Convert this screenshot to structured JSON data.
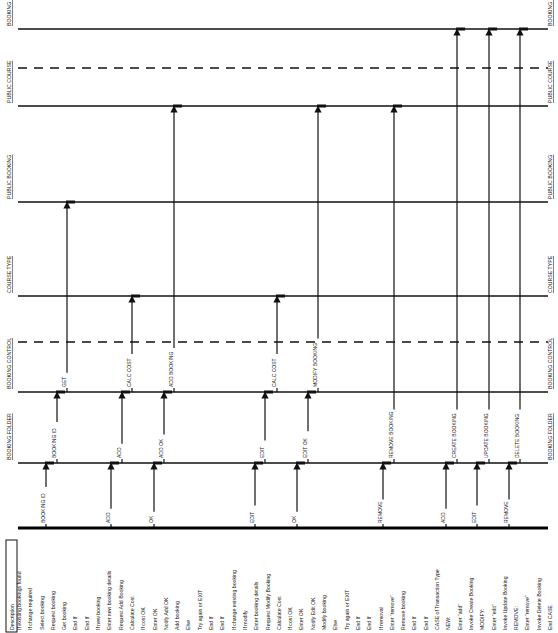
{
  "diagram": {
    "lifelines": [
      {
        "id": "booking_dtx",
        "label": "BOOKING DTX",
        "y": 29,
        "style": "solid"
      },
      {
        "id": "sep1",
        "label": "",
        "y": 68,
        "style": "dashed"
      },
      {
        "id": "public_course",
        "label": "PUBLIC COURSE",
        "y": 106,
        "style": "solid"
      },
      {
        "id": "public_booking",
        "label": "PUBLIC BOOKING",
        "y": 202,
        "style": "solid"
      },
      {
        "id": "course_type",
        "label": "COURSE TYPE",
        "y": 296,
        "style": "solid"
      },
      {
        "id": "sep2",
        "label": "",
        "y": 342,
        "style": "dashed"
      },
      {
        "id": "booking_control",
        "label": "BOOKING CONTROL",
        "y": 392,
        "style": "solid"
      },
      {
        "id": "booking_folder",
        "label": "BOOKING FOLDER",
        "y": 463,
        "style": "solid"
      }
    ],
    "actor_line_y": 528,
    "messages": [
      {
        "label": "BOOKING ID",
        "x": 46,
        "from_y": 528,
        "to_y": 463
      },
      {
        "label": "ADD",
        "x": 111,
        "from_y": 528,
        "to_y": 463
      },
      {
        "label": "OK",
        "x": 154,
        "from_y": 528,
        "to_y": 463
      },
      {
        "label": "EDIT",
        "x": 255,
        "from_y": 528,
        "to_y": 463
      },
      {
        "label": "OK",
        "x": 297,
        "from_y": 528,
        "to_y": 463
      },
      {
        "label": "REMOVE",
        "x": 383,
        "from_y": 528,
        "to_y": 463
      },
      {
        "label": "ADD",
        "x": 446,
        "from_y": 528,
        "to_y": 463
      },
      {
        "label": "EDIT",
        "x": 477,
        "from_y": 528,
        "to_y": 463
      },
      {
        "label": "REMOVE",
        "x": 509,
        "from_y": 528,
        "to_y": 463
      },
      {
        "label": "BOOKING ID",
        "x": 57,
        "from_y": 463,
        "to_y": 392
      },
      {
        "label": "ADD",
        "x": 122,
        "from_y": 463,
        "to_y": 392
      },
      {
        "label": "ADD OK",
        "x": 164,
        "from_y": 463,
        "to_y": 392
      },
      {
        "label": "EDIT",
        "x": 265,
        "from_y": 463,
        "to_y": 392
      },
      {
        "label": "EDIT OK",
        "x": 308,
        "from_y": 463,
        "to_y": 392
      },
      {
        "label": "GET",
        "x": 67,
        "from_y": 392,
        "to_y": 202
      },
      {
        "label": "CALC COST",
        "x": 132,
        "from_y": 392,
        "to_y": 296
      },
      {
        "label": "ADD BOOKING",
        "x": 174,
        "from_y": 392,
        "to_y": 106
      },
      {
        "label": "CALC COST",
        "x": 277,
        "from_y": 392,
        "to_y": 296
      },
      {
        "label": "MODIFY BOOKING",
        "x": 318,
        "from_y": 392,
        "to_y": 106
      },
      {
        "label": "REMOVE BOOKING",
        "x": 394,
        "from_y": 463,
        "to_y": 106
      },
      {
        "label": "CREATE BOOKING",
        "x": 457,
        "from_y": 463,
        "to_y": 29
      },
      {
        "label": "UPDATE BOOKING",
        "x": 489,
        "from_y": 463,
        "to_y": 29
      },
      {
        "label": "DELETE BOOKING",
        "x": 520,
        "from_y": 463,
        "to_y": 29
      }
    ],
    "description": {
      "header": "Description",
      "lines": [
        "If existing bookings found",
        "If change required",
        "Select booking",
        "Request booking",
        "Get booking",
        "End If",
        "End If",
        "If new booking",
        "Enter new booking details",
        "Request Add Booking",
        "Calculate Cost",
        "If cost OK",
        "Enter OK",
        "Notify Add OK",
        "Add booking",
        "Else",
        "Try again or EXIT",
        "End If",
        "End If",
        "If change existing booking",
        "If modify",
        "Enter booking details",
        "Request Modify Booking",
        "Calculate Cost",
        "If cost OK",
        "Enter OK",
        "Notify Edit OK",
        "Modify booking",
        "Else",
        "Try again or EXIT",
        "End If",
        "End If",
        "If removal",
        "Enter \"remove\"",
        "Remove booking",
        "End If",
        "End If",
        "CASE of Transaction Type",
        "NEW:",
        "Enter \"add\"",
        "Invoke Create Booking",
        "MODIFY:",
        "Enter \"edit\"",
        "Invoke Update Booking",
        "REMOVE:",
        "Enter \"remove\"",
        "Invoke Delete Booking",
        "End CASE"
      ]
    }
  }
}
